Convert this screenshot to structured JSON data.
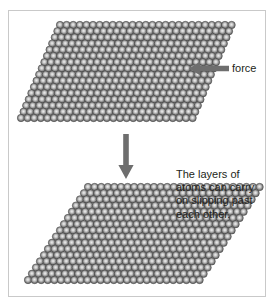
{
  "figure": {
    "background_color": "#ffffff",
    "frame_color": "#c9c9c9"
  },
  "labels": {
    "force": "force",
    "slip_text_lines": [
      "The layers of",
      "atoms can carry",
      "on slipping past",
      "each other."
    ],
    "slip_text_full": "The layers of atoms can carry on slipping past each other.",
    "text_color": "#231f20"
  },
  "arrows": {
    "force_arrow": {
      "name": "force-arrow",
      "direction": "left",
      "color": "#6e6e6e"
    },
    "transition_arrow": {
      "name": "down-arrow",
      "direction": "down",
      "color": "#6e6e6e"
    }
  },
  "lattices": [
    {
      "id": "lattice-top",
      "state": "before-slip",
      "rows": 16,
      "columns": 27,
      "shear_per_row": -2.6,
      "row_spacing": 6.2,
      "column_spacing": 6.6,
      "atom_diameter": 7.4,
      "atom_color_edge": "#4f4f4f",
      "atom_color_center": "#e6e6e6"
    },
    {
      "id": "lattice-bottom",
      "state": "after-slip",
      "rows": 16,
      "columns": 27,
      "shear_per_row": -4.0,
      "row_spacing": 6.2,
      "column_spacing": 6.6,
      "atom_diameter": 7.4,
      "atom_color_edge": "#4f4f4f",
      "atom_color_center": "#e6e6e6"
    }
  ]
}
